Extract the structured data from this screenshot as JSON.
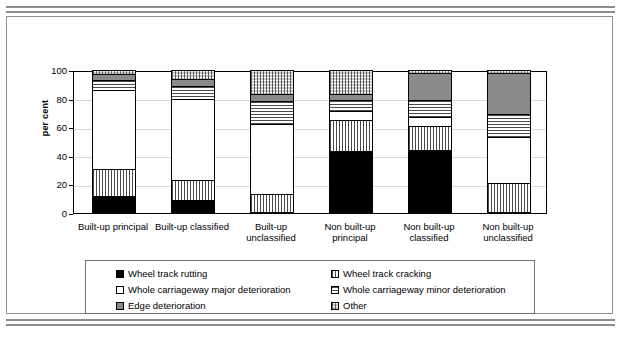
{
  "chart_data": {
    "type": "bar",
    "stacked": true,
    "title": "",
    "xlabel": "",
    "ylabel": "per cent",
    "ylim": [
      0,
      100
    ],
    "yticks": [
      0,
      20,
      40,
      60,
      80,
      100
    ],
    "grid": true,
    "legend_position": "bottom",
    "categories": [
      "Built-up principal",
      "Built-up classified",
      "Built-up unclassified",
      "Non built-up principal",
      "Non built-up classified",
      "Non built-up unclassified"
    ],
    "category_lines": [
      [
        "Built-up principal"
      ],
      [
        "Built-up classified"
      ],
      [
        "Built-up",
        "unclassified"
      ],
      [
        "Non built-up",
        "principal"
      ],
      [
        "Non built-up",
        "classified"
      ],
      [
        "Non built-up",
        "unclassified"
      ]
    ],
    "series": [
      {
        "name": "Wheel track rutting",
        "pattern": "solid-black",
        "values": [
          12,
          9,
          0,
          43,
          44,
          0
        ]
      },
      {
        "name": "Wheel track cracking",
        "pattern": "vertical-lines",
        "values": [
          19,
          14,
          13,
          22,
          17,
          21
        ]
      },
      {
        "name": "Whole carriageway major deterioration",
        "pattern": "solid-white",
        "values": [
          55,
          57,
          49,
          6,
          6,
          32
        ]
      },
      {
        "name": "Whole carriageway minor deterioration",
        "pattern": "horizontal-lines",
        "values": [
          7,
          9,
          16,
          8,
          12,
          16
        ]
      },
      {
        "name": "Edge deterioration",
        "pattern": "solid-grey",
        "values": [
          4,
          5,
          5,
          4,
          19,
          29
        ]
      },
      {
        "name": "Other",
        "pattern": "fine-dots",
        "values": [
          3,
          6,
          17,
          17,
          2,
          2
        ]
      }
    ]
  },
  "legend": {
    "entries": [
      {
        "label": "Wheel track rutting",
        "pattern": "solid-black"
      },
      {
        "label": "Wheel track cracking",
        "pattern": "vertical-lines"
      },
      {
        "label": "Whole carriageway major deterioration",
        "pattern": "solid-white"
      },
      {
        "label": "Whole carriageway minor deterioration",
        "pattern": "horizontal-lines"
      },
      {
        "label": "Edge deterioration",
        "pattern": "solid-grey"
      },
      {
        "label": "Other",
        "pattern": "fine-dots"
      }
    ]
  },
  "colors": {
    "black": "#000000",
    "white": "#ffffff",
    "grey": "#8a8a8a",
    "pattern_ink": "#4a4a4a",
    "gridline": "#d9d9d9",
    "frame": "#8f8f8f"
  }
}
